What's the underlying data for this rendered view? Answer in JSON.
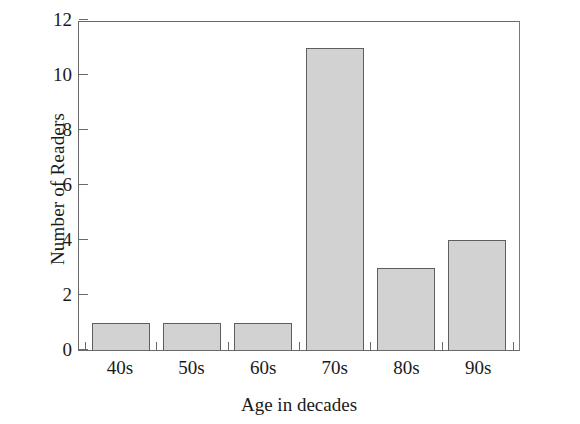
{
  "chart_data": {
    "type": "bar",
    "title": "",
    "xlabel": "Age in decades",
    "ylabel": "Number of Readers",
    "categories": [
      "40s",
      "50s",
      "60s",
      "70s",
      "80s",
      "90s"
    ],
    "values": [
      1,
      1,
      1,
      11,
      3,
      4
    ],
    "ylim": [
      0,
      12
    ],
    "y_ticks": [
      0,
      2,
      4,
      6,
      8,
      10,
      12
    ],
    "y_tick_labels": [
      "0",
      "2",
      "4",
      "6",
      "8",
      "10",
      "12"
    ],
    "grid": false,
    "legend": false,
    "legend_position": "none",
    "bar_fill_color": "#d2d2d2",
    "bar_edge_color": "#5e5e5e",
    "axis_color": "#6a6a6a",
    "background_color": "#ffffff"
  }
}
